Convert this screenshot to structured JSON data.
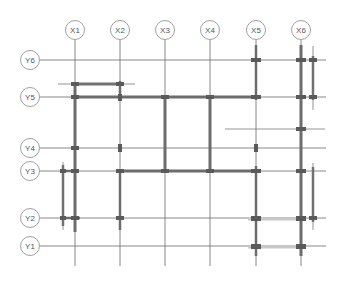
{
  "diagram": {
    "type": "structural-grid-plan",
    "colors": {
      "grid_line": "#6a6a6a",
      "beam": "#707070",
      "beam_light": "#c8c8c8",
      "bubble_stroke": "#888888",
      "label": "#555555"
    },
    "x_axes": [
      {
        "label": "X1",
        "x": 75
      },
      {
        "label": "X2",
        "x": 120
      },
      {
        "label": "X3",
        "x": 165
      },
      {
        "label": "X4",
        "x": 210
      },
      {
        "label": "X5",
        "x": 256
      },
      {
        "label": "X6",
        "x": 301
      }
    ],
    "y_axes": [
      {
        "label": "Y6",
        "y": 60
      },
      {
        "label": "Y5",
        "y": 97
      },
      {
        "label": "Y4",
        "y": 148
      },
      {
        "label": "Y3",
        "y": 171
      },
      {
        "label": "Y2",
        "y": 218
      },
      {
        "label": "Y1",
        "y": 246
      }
    ]
  }
}
